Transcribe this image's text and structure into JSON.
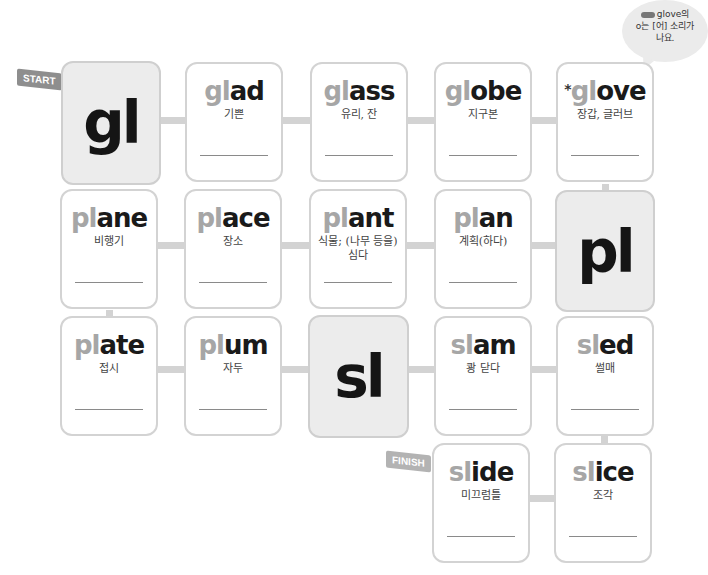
{
  "flags": {
    "start": "START",
    "finish": "FINISH"
  },
  "bubble": {
    "line1": "glove의",
    "line2": "o는 [어] 소리가",
    "line3": "나요."
  },
  "colors": {
    "card_border": "#d3d3d3",
    "blend_bg": "#ececec",
    "prefix_gray": "#a6a6a6",
    "word_dark": "#1a1a1a"
  },
  "cards": [
    {
      "type": "blend",
      "text": "gl"
    },
    {
      "type": "word",
      "prefix": "gl",
      "rest": "ad",
      "meaning": "기쁜"
    },
    {
      "type": "word",
      "prefix": "gl",
      "rest": "ass",
      "meaning": "유리, 잔"
    },
    {
      "type": "word",
      "prefix": "gl",
      "rest": "obe",
      "meaning": "지구본"
    },
    {
      "type": "word",
      "star": "*",
      "prefix": "gl",
      "rest": "ove",
      "meaning": "장갑, 글러브"
    },
    {
      "type": "word",
      "prefix": "pl",
      "rest": "ane",
      "meaning": "비행기"
    },
    {
      "type": "word",
      "prefix": "pl",
      "rest": "ace",
      "meaning": "장소"
    },
    {
      "type": "word",
      "prefix": "pl",
      "rest": "ant",
      "meaning": "식물; (나무 등을) 심다"
    },
    {
      "type": "word",
      "prefix": "pl",
      "rest": "an",
      "meaning": "계획(하다)"
    },
    {
      "type": "blend",
      "text": "pl"
    },
    {
      "type": "word",
      "prefix": "pl",
      "rest": "ate",
      "meaning": "접시"
    },
    {
      "type": "word",
      "prefix": "pl",
      "rest": "um",
      "meaning": "자두"
    },
    {
      "type": "blend",
      "text": "sl"
    },
    {
      "type": "word",
      "prefix": "sl",
      "rest": "am",
      "meaning": "쾅 닫다"
    },
    {
      "type": "word",
      "prefix": "sl",
      "rest": "ed",
      "meaning": "썰매"
    },
    {
      "type": "word",
      "prefix": "sl",
      "rest": "ide",
      "meaning": "미끄럼틀"
    },
    {
      "type": "word",
      "prefix": "sl",
      "rest": "ice",
      "meaning": "조각"
    }
  ]
}
